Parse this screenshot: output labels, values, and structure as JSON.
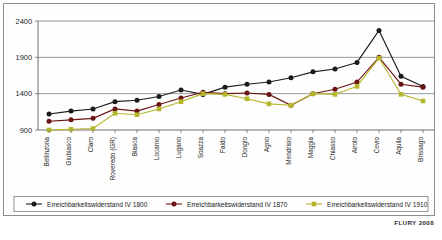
{
  "source_note": "FLURY 2008",
  "chart_data": {
    "type": "line",
    "title": "",
    "subtitle": "",
    "xlabel": "",
    "ylabel": "",
    "ylim": [
      900,
      2400
    ],
    "yticks": [
      900,
      1400,
      1900,
      2400
    ],
    "grid": true,
    "legend_position": "bottom",
    "categories": [
      "Bellinzona",
      "Giubiasco",
      "Claro",
      "Roveredo (GR)",
      "Biasca",
      "Locarno",
      "Lugano",
      "Soazza",
      "Faido",
      "Dongio",
      "Agno",
      "Mendrisio",
      "Maggia",
      "Chiasso",
      "Airolo",
      "Cevio",
      "Aquila",
      "Brissago"
    ],
    "series": [
      {
        "name": "Erreichbarkeitswiderstand IV 1800",
        "color": "#1b1b1b",
        "marker": "circle",
        "values": [
          1120,
          1160,
          1190,
          1290,
          1310,
          1360,
          1450,
          1390,
          1490,
          1530,
          1560,
          1620,
          1700,
          1740,
          1830,
          2270,
          1640,
          1500
        ]
      },
      {
        "name": "Erreichbarkeitswiderstand IV 1870",
        "color": "#6b1414",
        "marker": "circle",
        "values": [
          1020,
          1040,
          1060,
          1190,
          1160,
          1250,
          1340,
          1420,
          1400,
          1410,
          1390,
          1240,
          1400,
          1460,
          1560,
          1900,
          1530,
          1490
        ]
      },
      {
        "name": "Erreichbarkeitswiderstand IV 1910",
        "color": "#b5b72b",
        "marker": "square",
        "values": [
          900,
          910,
          920,
          1130,
          1110,
          1190,
          1290,
          1400,
          1390,
          1330,
          1260,
          1240,
          1400,
          1390,
          1500,
          1890,
          1390,
          1300
        ]
      }
    ]
  }
}
